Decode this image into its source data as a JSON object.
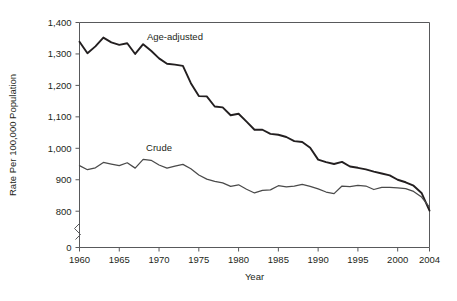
{
  "chart_data": {
    "type": "line",
    "title": "",
    "xlabel": "Year",
    "ylabel": "Rate Per 100,000 Population",
    "xlim": [
      1960,
      2004
    ],
    "ylim": [
      780,
      1400
    ],
    "yticks": [
      0,
      800,
      900,
      1000,
      1100,
      1200,
      1300,
      1400
    ],
    "ytick_labels": [
      "0",
      "800",
      "900",
      "1,000",
      "1,100",
      "1,200",
      "1,300",
      "1,400"
    ],
    "xticks": [
      1960,
      1965,
      1970,
      1975,
      1980,
      1985,
      1990,
      1995,
      2000,
      2004
    ],
    "xtick_labels": [
      "1960",
      "1965",
      "1970",
      "1975",
      "1980",
      "1985",
      "1990",
      "1995",
      "2000",
      "2004"
    ],
    "axis_break": true,
    "axis_break_between": [
      800,
      0
    ],
    "grid": false,
    "legend": "inline-annotations",
    "x": [
      1960,
      1961,
      1962,
      1963,
      1964,
      1965,
      1966,
      1967,
      1968,
      1969,
      1970,
      1971,
      1972,
      1973,
      1974,
      1975,
      1976,
      1977,
      1978,
      1979,
      1980,
      1981,
      1982,
      1983,
      1984,
      1985,
      1986,
      1987,
      1988,
      1989,
      1990,
      1991,
      1992,
      1993,
      1994,
      1995,
      1996,
      1997,
      1998,
      1999,
      2000,
      2001,
      2002,
      2003,
      2004
    ],
    "series": [
      {
        "name": "Age-adjusted",
        "color": "#231f20",
        "label_x": 1972,
        "label_y": 1345,
        "values": [
          1339,
          1302,
          1324,
          1352,
          1337,
          1329,
          1334,
          1300,
          1331,
          1310,
          1286,
          1269,
          1266,
          1262,
          1207,
          1166,
          1165,
          1133,
          1130,
          1105,
          1110,
          1085,
          1059,
          1059,
          1046,
          1043,
          1036,
          1023,
          1020,
          1002,
          964,
          956,
          950,
          957,
          942,
          938,
          933,
          926,
          920,
          914,
          900,
          892,
          881,
          858,
          802
        ]
      },
      {
        "name": "Crude",
        "color": "#4a4a4a",
        "label_x": 1970,
        "label_y": 990,
        "values": [
          945,
          932,
          938,
          955,
          950,
          945,
          954,
          937,
          965,
          962,
          947,
          937,
          943,
          949,
          935,
          915,
          902,
          895,
          890,
          879,
          884,
          870,
          858,
          866,
          868,
          881,
          877,
          880,
          885,
          879,
          871,
          861,
          856,
          880,
          878,
          882,
          880,
          869,
          876,
          876,
          874,
          872,
          863,
          845,
          813
        ]
      }
    ]
  }
}
